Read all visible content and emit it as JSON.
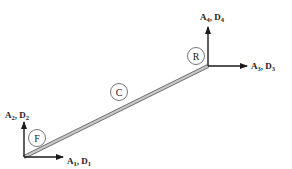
{
  "diagram": {
    "type": "beam-element-dof",
    "colors": {
      "line": "#1a1a1a",
      "beam_fill": "#bdbdbd",
      "beam_edge": "#6a6a6a",
      "node_circle": "#555555"
    },
    "nodes": {
      "front": {
        "label": "F"
      },
      "center": {
        "label": "C"
      },
      "rear": {
        "label": "R"
      }
    },
    "dofs": {
      "d1": {
        "main": "A",
        "sub1": "1",
        "sep": ", ",
        "main2": "D",
        "sub2": "1"
      },
      "d2": {
        "main": "A",
        "sub1": "2",
        "sep": ", ",
        "main2": "D",
        "sub2": "2"
      },
      "d3": {
        "main": "A",
        "sub1": "3",
        "sep": ", ",
        "main2": "D",
        "sub2": "3"
      },
      "d4": {
        "main": "A",
        "sub1": "4",
        "sep": ", ",
        "main2": "D",
        "sub2": "4"
      }
    }
  }
}
